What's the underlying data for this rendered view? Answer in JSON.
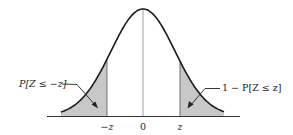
{
  "diagram": {
    "type": "standard-normal-density",
    "center_label": "0",
    "left_tick_label": "−z",
    "right_tick_label": "z",
    "left_area_label": "P[Z ≤ −z]",
    "right_area_label": "1 − P[Z ≤ z]",
    "colors": {
      "curve": "#1a1a1a",
      "shade": "#c8c8c8",
      "axis": "#333333",
      "center_line": "#888888"
    }
  }
}
